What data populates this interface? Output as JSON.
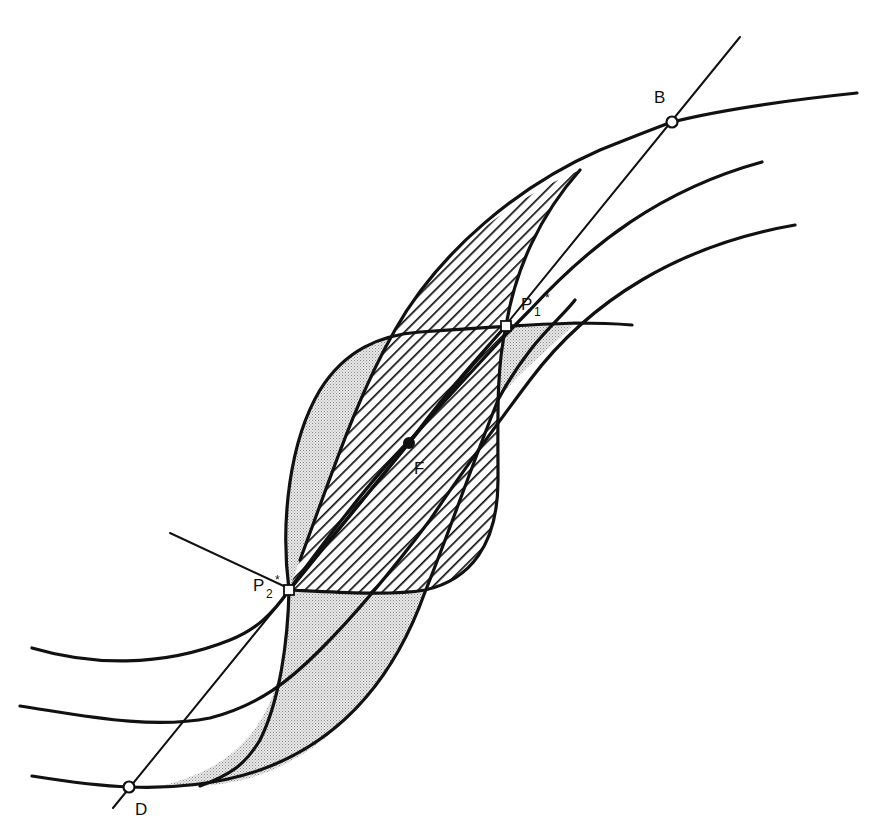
{
  "figure": {
    "labels": {
      "B": "B",
      "D": "D",
      "F": "F",
      "P1": "P",
      "P1_sub": "1",
      "P1_star": "*",
      "P2": "P",
      "P2_sub": "2",
      "P2_star": "*"
    },
    "points": {
      "B": {
        "x": 672,
        "y": 122,
        "marker": "open-circle"
      },
      "D": {
        "x": 129,
        "y": 787,
        "marker": "open-circle"
      },
      "F": {
        "x": 409,
        "y": 443,
        "marker": "filled-dot"
      },
      "P1_star": {
        "x": 506,
        "y": 326,
        "marker": "open-square"
      },
      "P2_star": {
        "x": 289,
        "y": 590,
        "marker": "open-square"
      }
    },
    "regions": [
      {
        "name": "hatched-lens",
        "fill": "diagonal-hatch"
      },
      {
        "name": "stippled-region",
        "fill": "stipple"
      }
    ],
    "colors": {
      "ink": "#111111",
      "stipple": "#cfcfcf",
      "background": "#ffffff"
    },
    "caption": ""
  }
}
